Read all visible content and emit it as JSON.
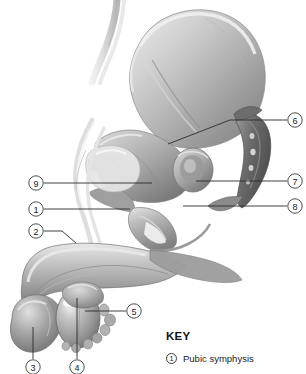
{
  "figure": {
    "background_color": "#ffffff",
    "ink_color": "#2b2b2b"
  },
  "callouts": [
    {
      "id": "callout-9",
      "number": "9",
      "cx": 36,
      "cy": 183
    },
    {
      "id": "callout-1",
      "number": "1",
      "cx": 36,
      "cy": 209
    },
    {
      "id": "callout-2",
      "number": "2",
      "cx": 36,
      "cy": 231
    },
    {
      "id": "callout-3",
      "number": "3",
      "cx": 33,
      "cy": 367
    },
    {
      "id": "callout-4",
      "number": "4",
      "cx": 77,
      "cy": 367
    },
    {
      "id": "callout-5",
      "number": "5",
      "cx": 134,
      "cy": 311
    },
    {
      "id": "callout-6",
      "number": "6",
      "cx": 295,
      "cy": 120
    },
    {
      "id": "callout-7",
      "number": "7",
      "cx": 295,
      "cy": 181
    },
    {
      "id": "callout-8",
      "number": "8",
      "cx": 295,
      "cy": 206
    }
  ],
  "key": {
    "title": "KEY",
    "items": [
      {
        "number": "1",
        "label": "Pubic symphysis"
      }
    ]
  },
  "anatomy_regions": [
    {
      "name": "hip-bone-ilium"
    },
    {
      "name": "sacrum-coccyx"
    },
    {
      "name": "ureter-tube"
    },
    {
      "name": "urinary-bladder"
    },
    {
      "name": "prostate-gland"
    },
    {
      "name": "penis-shaft"
    },
    {
      "name": "glans-penis"
    },
    {
      "name": "testis"
    },
    {
      "name": "epididymis"
    },
    {
      "name": "vas-deferens"
    }
  ]
}
